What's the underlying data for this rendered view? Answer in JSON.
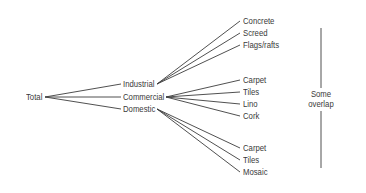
{
  "root": {
    "label": "Total"
  },
  "categories": [
    {
      "label": "Industrial",
      "children": [
        "Concrete",
        "Screed",
        "Flags/rafts"
      ]
    },
    {
      "label": "Commercial",
      "children": [
        "Carpet",
        "Tiles",
        "Lino",
        "Cork"
      ]
    },
    {
      "label": "Domestic",
      "children": [
        "Carpet",
        "Tiles",
        "Mosaic"
      ]
    }
  ],
  "bracket": {
    "line1": "Some",
    "line2": "overlap"
  },
  "colors": {
    "line": "#3c3c3c",
    "text": "#3a3a3a",
    "background": "#ffffff"
  }
}
